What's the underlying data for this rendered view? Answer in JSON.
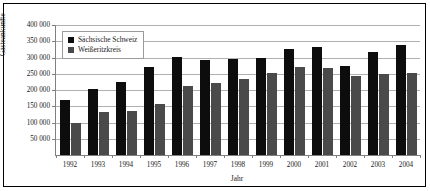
{
  "chart_data": {
    "type": "bar",
    "title": "",
    "subtitle": "",
    "xlabel": "Jahr",
    "ylabel": "Gästeankünfte",
    "categories": [
      "1992",
      "1993",
      "1994",
      "1995",
      "1996",
      "1997",
      "1998",
      "1999",
      "2000",
      "2001",
      "2002",
      "2003",
      "2004"
    ],
    "series": [
      {
        "name": "Sächsische Schweiz",
        "color": "#0d0d0d",
        "values": [
          168000,
          202000,
          226000,
          272000,
          301000,
          292000,
          296000,
          297000,
          325000,
          331000,
          274000,
          317000,
          340000
        ]
      },
      {
        "name": "Weißeritzkreis",
        "color": "#4a4a4a",
        "values": [
          99000,
          131000,
          136000,
          158000,
          212000,
          222000,
          234000,
          253000,
          271000,
          267000,
          242000,
          250000,
          252000
        ]
      }
    ],
    "ylim": [
      0,
      400000
    ],
    "ytick_values": [
      0,
      50000,
      100000,
      150000,
      200000,
      250000,
      300000,
      350000,
      400000
    ],
    "ytick_labels": [
      "",
      "50 000",
      "100 000",
      "150 000",
      "200 000",
      "250 000",
      "300 000",
      "350 000",
      "400 000"
    ],
    "grid": true,
    "grid_axis": "y",
    "legend_position": "top-left-inside",
    "legend_entries": [
      "Sächsische Schweiz",
      "Weißeritzkreis"
    ]
  }
}
